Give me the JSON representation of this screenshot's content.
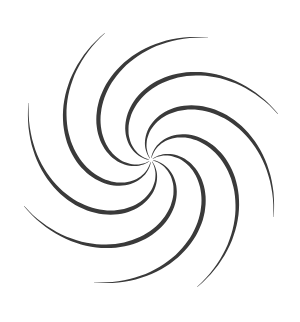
{
  "graphic": {
    "type": "swirl",
    "center": [
      151,
      160
    ],
    "arm_count": 8,
    "color": "#3a3a3a",
    "background": "#ffffff",
    "inner_radius": 2,
    "outer_radius": 135,
    "twist_degrees": 150,
    "max_width": 6,
    "rotation_offset_degrees": 10
  }
}
